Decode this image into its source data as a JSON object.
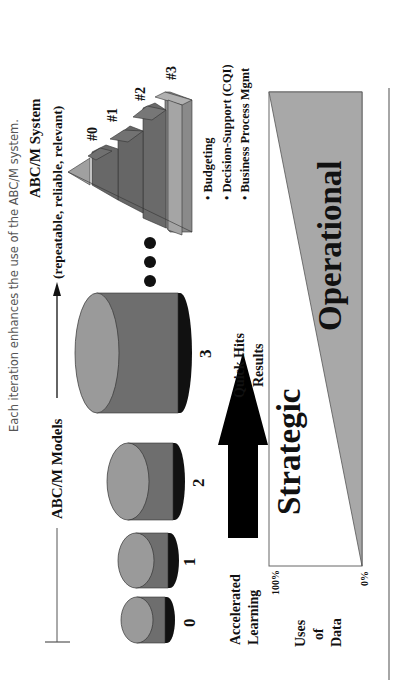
{
  "caption": "Each iteration enhances the use of the ABC/M system.",
  "header": {
    "models_label": "ABC/M Models",
    "system_title": "ABC/M System",
    "system_subtitle": "(repeatable, reliable, relevant)"
  },
  "models": [
    {
      "label": "0"
    },
    {
      "label": "1"
    },
    {
      "label": "2"
    },
    {
      "label": "3"
    }
  ],
  "continuation": "•••",
  "pyramid": {
    "tiers": [
      "#0",
      "#1",
      "#2",
      "#3"
    ],
    "bullets": [
      "• Budgeting",
      "• Decision-Support (CQI)",
      "• Business Process Mgmt"
    ]
  },
  "arrow": {
    "start_label_line1": "Accelerated",
    "start_label_line2": "Learning",
    "end_label_line1": "Quick Hits",
    "end_label_line2": "Results"
  },
  "uses_chart": {
    "axis_label_line1": "Uses",
    "axis_label_line2": "of",
    "axis_label_line3": "Data",
    "top_tick": "100%",
    "bottom_tick": "0%",
    "region_strategic": "Strategic",
    "region_operational": "Operational"
  },
  "colors": {
    "cylinder_face": "#9a9a9a",
    "cylinder_body": "#6e6e6e",
    "operational_fill": "#a8a8a8",
    "rule": "#888888"
  }
}
